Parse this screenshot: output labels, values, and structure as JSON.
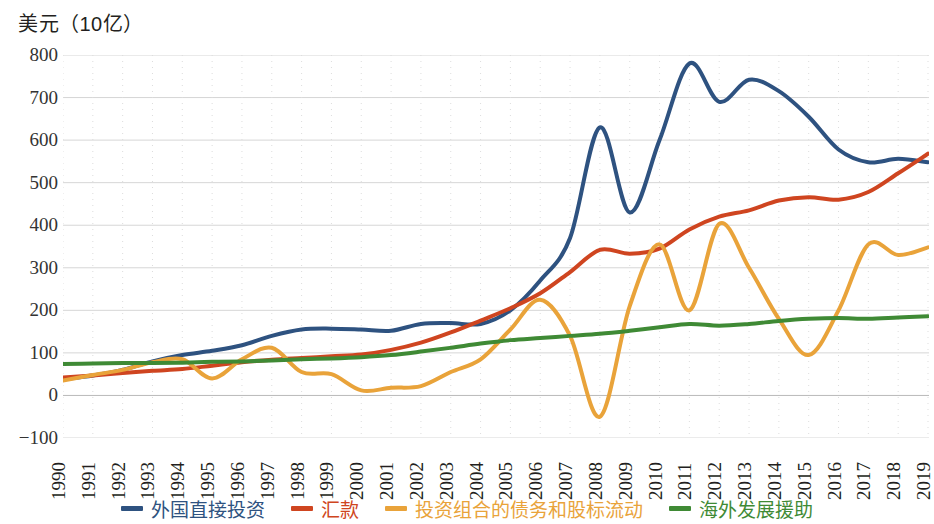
{
  "chart_data": {
    "type": "line",
    "title": "美元（10亿）",
    "ylabel": "美元（10亿）",
    "xlabel": "",
    "grid": true,
    "legend_position": "bottom",
    "ylim": [
      -100,
      800
    ],
    "yticks": [
      800,
      700,
      600,
      500,
      400,
      300,
      200,
      100,
      0,
      -100
    ],
    "categories": [
      "1990",
      "1991",
      "1992",
      "1993",
      "1994",
      "1995",
      "1996",
      "1997",
      "1998",
      "1999",
      "2000",
      "2001",
      "2002",
      "2003",
      "2004",
      "2005",
      "2006",
      "2007",
      "2008",
      "2009",
      "2010",
      "2011",
      "2012",
      "2013",
      "2014",
      "2015",
      "2016",
      "2017",
      "2018",
      "2019"
    ],
    "series": [
      {
        "name": "外国直接投资",
        "color": "#2e5280",
        "values": [
          38,
          47,
          60,
          80,
          95,
          105,
          118,
          140,
          155,
          157,
          155,
          152,
          168,
          170,
          168,
          200,
          270,
          370,
          630,
          430,
          600,
          780,
          690,
          742,
          715,
          655,
          578,
          548,
          556,
          548
        ]
      },
      {
        "name": "汇款",
        "color": "#cf4520",
        "values": [
          42,
          47,
          53,
          58,
          62,
          70,
          78,
          84,
          88,
          92,
          96,
          107,
          124,
          148,
          176,
          205,
          240,
          290,
          342,
          333,
          345,
          390,
          420,
          435,
          458,
          466,
          460,
          478,
          522,
          568
        ]
      },
      {
        "name": "投资组合的债务和股标流动",
        "color": "#e9a33a",
        "values": [
          35,
          48,
          60,
          78,
          85,
          40,
          85,
          112,
          55,
          50,
          12,
          18,
          22,
          55,
          85,
          155,
          225,
          140,
          -50,
          210,
          355,
          200,
          403,
          300,
          180,
          95,
          200,
          355,
          330,
          348
        ]
      },
      {
        "name": "海外发展援助",
        "color": "#3f8a35",
        "values": [
          74,
          75,
          76,
          76,
          77,
          79,
          80,
          82,
          85,
          87,
          90,
          95,
          103,
          112,
          122,
          130,
          135,
          140,
          145,
          152,
          160,
          168,
          164,
          168,
          175,
          180,
          182,
          180,
          183,
          186
        ]
      }
    ]
  },
  "legend": {
    "items": [
      {
        "label": "外国直接投资",
        "color": "#2e5280"
      },
      {
        "label": "汇款",
        "color": "#cf4520"
      },
      {
        "label": "投资组合的债务和股标流动",
        "color": "#e9a33a"
      },
      {
        "label": "海外发展援助",
        "color": "#3f8a35"
      }
    ]
  }
}
